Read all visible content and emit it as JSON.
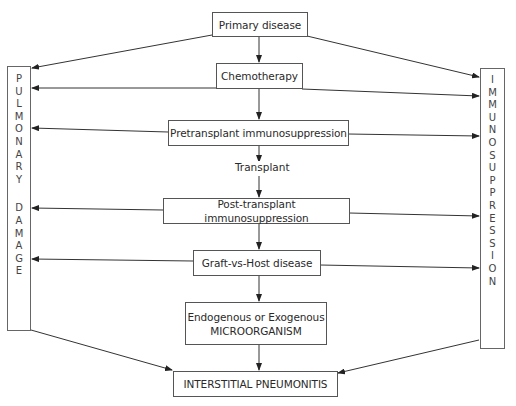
{
  "diagram": {
    "nodes": {
      "primary": "Primary disease",
      "chemo": "Chemotherapy",
      "pretransplant": "Pretransplant immunosuppression",
      "transplant_label": "Transplant",
      "posttransplant": "Post-transplant immunosuppression",
      "gvhd": "Graft-vs-Host disease",
      "micro_line1": "Endogenous or Exogenous",
      "micro_line2": "MICROORGANISM",
      "pneumonitis": "INTERSTITIAL PNEUMONITIS"
    },
    "left_column": {
      "word1": [
        "P",
        "U",
        "L",
        "M",
        "O",
        "N",
        "A",
        "R",
        "Y"
      ],
      "word2": [
        "D",
        "A",
        "M",
        "A",
        "G",
        "E"
      ],
      "text": "PULMONARY DAMAGE"
    },
    "right_column": {
      "letters": [
        "I",
        "M",
        "M",
        "U",
        "N",
        "O",
        "S",
        "U",
        "P",
        "P",
        "R",
        "E",
        "S",
        "S",
        "I",
        "O",
        "N"
      ],
      "text": "IMMUNOSUPPRESSION"
    },
    "edges": [
      {
        "from": "Primary disease",
        "to": "Chemotherapy"
      },
      {
        "from": "Chemotherapy",
        "to": "Pretransplant immunosuppression"
      },
      {
        "from": "Pretransplant immunosuppression",
        "to": "Post-transplant immunosuppression",
        "label": "Transplant"
      },
      {
        "from": "Post-transplant immunosuppression",
        "to": "Graft-vs-Host disease"
      },
      {
        "from": "Graft-vs-Host disease",
        "to": "Endogenous or Exogenous MICROORGANISM"
      },
      {
        "from": "Endogenous or Exogenous MICROORGANISM",
        "to": "INTERSTITIAL PNEUMONITIS"
      },
      {
        "from": "Primary disease",
        "to": "PULMONARY DAMAGE"
      },
      {
        "from": "Primary disease",
        "to": "IMMUNOSUPPRESSION"
      },
      {
        "from": "Chemotherapy",
        "to": "PULMONARY DAMAGE"
      },
      {
        "from": "Chemotherapy",
        "to": "IMMUNOSUPPRESSION"
      },
      {
        "from": "Pretransplant immunosuppression",
        "to": "PULMONARY DAMAGE"
      },
      {
        "from": "Pretransplant immunosuppression",
        "to": "IMMUNOSUPPRESSION"
      },
      {
        "from": "Post-transplant immunosuppression",
        "to": "PULMONARY DAMAGE"
      },
      {
        "from": "Post-transplant immunosuppression",
        "to": "IMMUNOSUPPRESSION"
      },
      {
        "from": "Graft-vs-Host disease",
        "to": "PULMONARY DAMAGE"
      },
      {
        "from": "Graft-vs-Host disease",
        "to": "IMMUNOSUPPRESSION"
      },
      {
        "from": "PULMONARY DAMAGE",
        "to": "INTERSTITIAL PNEUMONITIS"
      },
      {
        "from": "IMMUNOSUPPRESSION",
        "to": "INTERSTITIAL PNEUMONITIS"
      }
    ]
  }
}
